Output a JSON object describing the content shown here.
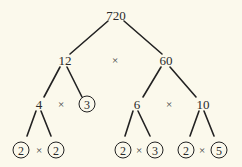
{
  "diagram": {
    "type": "factor-tree",
    "root": "720",
    "colors": {
      "background": "#fbf9ec",
      "line": "#222222",
      "text": "#2a2a2a"
    },
    "levels": {
      "level1": {
        "left": "12",
        "operator": "×",
        "right": "60"
      },
      "level2": {
        "left_composite": "4",
        "left_operator": "×",
        "left_prime": "3",
        "right_left": "6",
        "right_operator": "×",
        "right_right": "10"
      },
      "level3": {
        "from_4": {
          "a": "2",
          "operator": "×",
          "b": "2"
        },
        "from_6": {
          "a": "2",
          "operator": "×",
          "b": "3"
        },
        "from_10": {
          "a": "2",
          "operator": "×",
          "b": "5"
        }
      }
    },
    "prime_factors_circled": [
      "2",
      "2",
      "3",
      "2",
      "3",
      "2",
      "5"
    ],
    "edges": [
      {
        "from": "720",
        "to": "12",
        "x1": 108,
        "y1": 21,
        "x2": 70,
        "y2": 54
      },
      {
        "from": "720",
        "to": "60",
        "x1": 124,
        "y1": 21,
        "x2": 162,
        "y2": 54
      },
      {
        "from": "12",
        "to": "4",
        "x1": 60,
        "y1": 67,
        "x2": 44,
        "y2": 97
      },
      {
        "from": "12",
        "to": "3",
        "x1": 67,
        "y1": 67,
        "x2": 82,
        "y2": 97
      },
      {
        "from": "60",
        "to": "6",
        "x1": 161,
        "y1": 67,
        "x2": 143,
        "y2": 97
      },
      {
        "from": "60",
        "to": "10",
        "x1": 170,
        "y1": 67,
        "x2": 196,
        "y2": 97
      },
      {
        "from": "4",
        "to": "2",
        "x1": 36,
        "y1": 111,
        "x2": 27,
        "y2": 136
      },
      {
        "from": "4",
        "to": "2",
        "x1": 41,
        "y1": 111,
        "x2": 51,
        "y2": 136
      },
      {
        "from": "6",
        "to": "2",
        "x1": 133,
        "y1": 111,
        "x2": 125,
        "y2": 136
      },
      {
        "from": "6",
        "to": "3",
        "x1": 138,
        "y1": 111,
        "x2": 150,
        "y2": 136
      },
      {
        "from": "10",
        "to": "2",
        "x1": 199,
        "y1": 111,
        "x2": 190,
        "y2": 136
      },
      {
        "from": "10",
        "to": "5",
        "x1": 204,
        "y1": 111,
        "x2": 214,
        "y2": 136
      }
    ]
  }
}
